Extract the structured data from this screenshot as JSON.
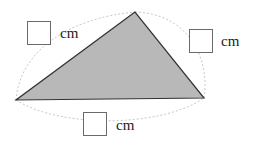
{
  "diagram": {
    "type": "triangle-perimeter",
    "fill_color": "#b8b8b8",
    "stroke_color": "#333333",
    "arc_color": "#c8c8c8",
    "vertices": {
      "top": [
        135,
        12
      ],
      "left": [
        16,
        100
      ],
      "right": [
        204,
        98
      ]
    },
    "sides": [
      {
        "name": "left-side",
        "unit": "cm",
        "value": ""
      },
      {
        "name": "right-side",
        "unit": "cm",
        "value": ""
      },
      {
        "name": "bottom-side",
        "unit": "cm",
        "value": ""
      }
    ]
  }
}
